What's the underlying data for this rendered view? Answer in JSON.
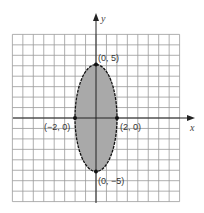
{
  "chart_data": {
    "type": "diagram",
    "title": "",
    "xlabel": "x",
    "ylabel": "y",
    "xlim": [
      -8,
      8
    ],
    "ylim": [
      -8,
      8
    ],
    "grid": true,
    "ellipse": {
      "center": [
        0,
        0
      ],
      "semi_x": 2,
      "semi_y": 5,
      "fill": "#a9a9a9",
      "stroke": "#111111"
    },
    "points": [
      {
        "x": 0,
        "y": 5,
        "label": "(0, 5)"
      },
      {
        "x": 0,
        "y": -5,
        "label": "(0, −5)"
      },
      {
        "x": -2,
        "y": 0,
        "label": "(−2, 0)"
      },
      {
        "x": 2,
        "y": 0,
        "label": "(2, 0)"
      }
    ]
  },
  "labels": {
    "x_axis": "x",
    "y_axis": "y",
    "top": "(0, 5)",
    "bottom": "(0, −5)",
    "left": "(−2, 0)",
    "right": "(2, 0)"
  },
  "colors": {
    "grid": "#9a9a9a",
    "axis": "#222222",
    "fill": "#a9a9a9",
    "stroke": "#111111"
  }
}
